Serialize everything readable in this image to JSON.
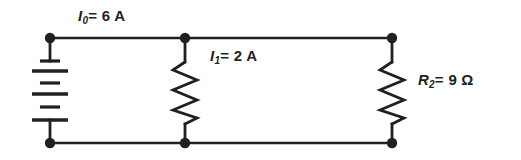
{
  "diagram": {
    "background_color": "#ffffff",
    "line_color": "#231f20",
    "labels": {
      "source_current": {
        "symbol": "I",
        "subscript": "0",
        "equals": "=",
        "value": "6 A",
        "full_text": "I0 = 6 A"
      },
      "branch_current": {
        "symbol": "I",
        "subscript": "1",
        "equals": "=",
        "value": "2 A",
        "full_text": "I1 = 2 A"
      },
      "resistance": {
        "symbol": "R",
        "subscript": "2",
        "equals": "=",
        "value": "9 Ω",
        "full_text": "R2 = 9 Ω"
      }
    },
    "components": {
      "battery": {
        "name": "battery",
        "plate_count": 6,
        "pattern": "short-long-short-long-short-long"
      },
      "resistor_1": {
        "name": "resistor-r1",
        "zigzag_peaks": 6
      },
      "resistor_2": {
        "name": "resistor-r2",
        "zigzag_peaks": 6
      }
    },
    "nodes": [
      {
        "name": "node-top-left",
        "x": 50,
        "y": 38
      },
      {
        "name": "node-top-middle",
        "x": 185,
        "y": 38
      },
      {
        "name": "node-top-right",
        "x": 392,
        "y": 38
      },
      {
        "name": "node-bottom-left",
        "x": 50,
        "y": 143
      },
      {
        "name": "node-bottom-middle",
        "x": 185,
        "y": 143
      },
      {
        "name": "node-bottom-right",
        "x": 392,
        "y": 143
      }
    ]
  }
}
